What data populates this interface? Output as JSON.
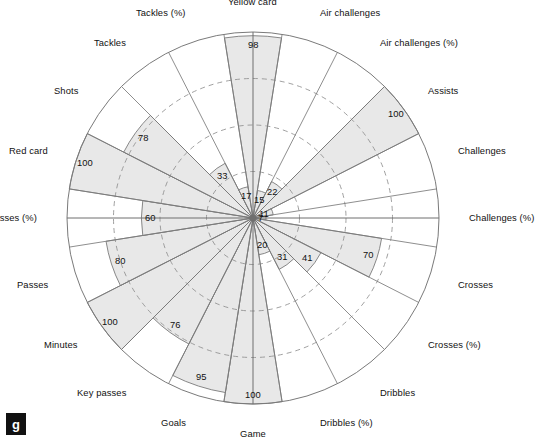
{
  "corner_tag": "g",
  "chart_data": {
    "type": "bar",
    "chart_style": "polar-rose",
    "title": "",
    "subtitle": "",
    "xlabel": "",
    "ylabel": "",
    "ylim": [
      0,
      100
    ],
    "grid": true,
    "grid_rings": [
      25,
      50,
      75
    ],
    "outer_ring": 100,
    "legend": "none",
    "start_angle_deg": 0,
    "direction": "clockwise",
    "categories": [
      "Air challenges",
      "Air challenges (%)",
      "Assists",
      "Challenges",
      "Challenges (%)",
      "Crosses",
      "Crosses (%)",
      "Dribbles",
      "Dribbles (%)",
      "Game",
      "Goals",
      "Key passes",
      "Minutes",
      "Passes",
      "Passes (%)",
      "Red card",
      "Shots",
      "Tackles",
      "Tackles (%)",
      "Yellow card"
    ],
    "values": [
      15,
      22,
      100,
      11,
      7,
      70,
      41,
      31,
      20,
      100,
      95,
      76,
      100,
      80,
      60,
      100,
      78,
      33,
      17,
      98
    ],
    "value_labels": [
      "15",
      "22",
      "100",
      "11",
      "7",
      "70",
      "41",
      "31",
      "20",
      "100",
      "95",
      "76",
      "100",
      "80",
      "60",
      "100",
      "78",
      "33",
      "17",
      "98"
    ],
    "colors": {
      "fill": "#e8e8e8",
      "stroke": "#7a7a7a",
      "grid": "#8f8f8f",
      "text": "#111111"
    }
  }
}
